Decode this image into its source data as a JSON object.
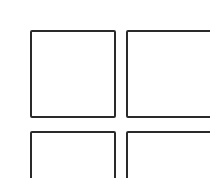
{
  "grid": {
    "stroke_color": "#2a2a2a",
    "background": "#ffffff",
    "tiles": [
      {
        "id": "top-left",
        "x": 30,
        "y": 30,
        "w": 85,
        "h": 88
      },
      {
        "id": "top-right",
        "x": 126,
        "y": 30,
        "w": 90,
        "h": 88
      },
      {
        "id": "bottom-left",
        "x": 30,
        "y": 131,
        "w": 85,
        "h": 60
      },
      {
        "id": "bottom-right",
        "x": 126,
        "y": 131,
        "w": 90,
        "h": 60
      }
    ]
  }
}
